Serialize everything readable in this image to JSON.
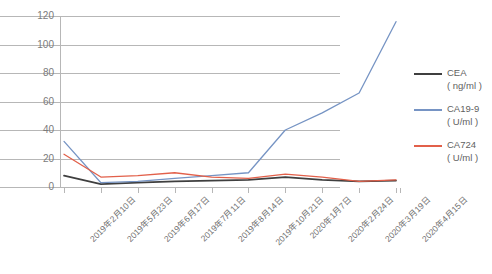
{
  "chart_data": {
    "type": "line",
    "title": "",
    "xlabel": "",
    "ylabel": "",
    "ylim": [
      0,
      120
    ],
    "yticks": [
      0,
      20,
      40,
      60,
      80,
      100,
      120
    ],
    "grid": true,
    "legend_position": "right",
    "categories": [
      "2019年2月10日",
      "2019年5月23日",
      "2019年6月17日",
      "2019年7月11日",
      "2019年8月14日",
      "2019年10月21日",
      "2020年1月7日",
      "2020年2月24日",
      "2020年3月19日",
      "2020年4月15日"
    ],
    "series": [
      {
        "name": "CEA",
        "unit": "( ng/ml )",
        "color": "#3f3f3f",
        "values": [
          8,
          2,
          3,
          4,
          4.5,
          5,
          7,
          5,
          4,
          4.5
        ]
      },
      {
        "name": "CA19-9",
        "unit": "( U/ml )",
        "color": "#7694c4",
        "values": [
          32,
          3,
          4,
          6,
          8,
          10,
          40,
          52,
          66,
          116
        ]
      },
      {
        "name": "CA724",
        "unit": "( U/ml )",
        "color": "#e2604a",
        "values": [
          23,
          7,
          8,
          10,
          7,
          6,
          9,
          7,
          4,
          5
        ]
      }
    ]
  },
  "axis": {
    "ytick_labels": [
      "120",
      "100",
      "80",
      "60",
      "40",
      "20",
      "0"
    ]
  },
  "legend": {
    "entries": [
      {
        "name": "CEA",
        "unit": "( ng/ml )"
      },
      {
        "name": "CA19-9",
        "unit": "( U/ml )"
      },
      {
        "name": "CA724",
        "unit": "( U/ml )"
      }
    ]
  },
  "colors": {
    "cea": "#3f3f3f",
    "ca19_9": "#7694c4",
    "ca724": "#e2604a",
    "grid": "#b7b7b7",
    "tick_text": "#7b7b7b",
    "background": "#ffffff"
  }
}
